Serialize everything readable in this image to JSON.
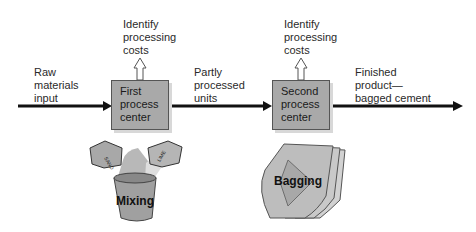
{
  "diagram": {
    "input_label": [
      "Raw",
      "materials",
      "input"
    ],
    "center1": {
      "lines": [
        "First",
        "process",
        "center"
      ],
      "cost_label": [
        "Identify",
        "processing",
        "costs"
      ]
    },
    "middle_label": [
      "Partly",
      "processed",
      "units"
    ],
    "center2": {
      "lines": [
        "Second",
        "process",
        "center"
      ],
      "cost_label": [
        "Identify",
        "processing",
        "costs"
      ]
    },
    "output_label": [
      "Finished",
      "product—",
      "bagged cement"
    ],
    "illustration1": {
      "label": "Mixing",
      "bag_labels": [
        "SAND",
        "LIME"
      ]
    },
    "illustration2": {
      "label": "Bagging"
    },
    "colors": {
      "box_fill": "#a9a9a9",
      "arrow": "#111111"
    }
  }
}
